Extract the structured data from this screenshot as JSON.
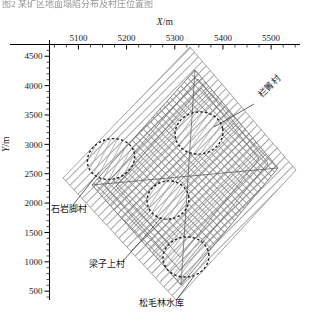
{
  "figure": {
    "cut_caption": "图2 某矿区地面塌陷分布及村庄位置图",
    "x_axis": {
      "label": "X",
      "unit": "/m",
      "ticks": [
        5100,
        5200,
        5300,
        5400,
        5500
      ],
      "minor_step": 25,
      "range": [
        5040,
        5560
      ]
    },
    "y_axis": {
      "label": "Y",
      "unit": "/m",
      "ticks": [
        4500,
        4000,
        3500,
        3000,
        2500,
        2000,
        1500,
        1000,
        500
      ],
      "minor_step": 100,
      "range": [
        350,
        4700
      ]
    },
    "annotations": [
      {
        "id": "lanqing",
        "text": "栏箐村",
        "x": 262,
        "y": 98,
        "rotate": -45
      },
      {
        "id": "shiyanjiao",
        "text": "石岩脚村",
        "x": 51,
        "y": 212,
        "rotate": 0
      },
      {
        "id": "liangzishang",
        "text": "梁子上村",
        "x": 89,
        "y": 267,
        "rotate": 0
      },
      {
        "id": "songmaolin",
        "text": "松毛林水库",
        "x": 139,
        "y": 306,
        "rotate": 0
      }
    ],
    "regions": {
      "outer_zone_name": "倾斜条带影响区",
      "inner_zone_name": "交叉网格采空区"
    },
    "villages": [
      {
        "id": "village-shiyanjiao",
        "cx": 111,
        "cy": 159,
        "rx": 24,
        "ry": 20,
        "rot": -18
      },
      {
        "id": "village-lanqing",
        "cx": 199,
        "cy": 133,
        "rx": 24,
        "ry": 21,
        "rot": -10
      },
      {
        "id": "village-liangzishang",
        "cx": 168,
        "cy": 200,
        "rx": 21,
        "ry": 19,
        "rot": -12
      },
      {
        "id": "village-songmaolin",
        "cx": 186,
        "cy": 257,
        "rx": 23,
        "ry": 20,
        "rot": -8
      }
    ],
    "colors": {
      "axis": "#000000",
      "hatch": "#8a8a8a",
      "grid": "#909090",
      "dashed": "#2b2b2b",
      "leader": "#3a3a3a"
    }
  }
}
